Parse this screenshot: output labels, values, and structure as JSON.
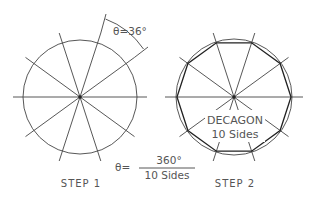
{
  "step1": {
    "label": "STEP 1",
    "angle_annotation": "θ=36°"
  },
  "step2": {
    "label": "STEP 2",
    "shape_name": "DECAGON",
    "sides_label": "10 Sides"
  },
  "formula": {
    "lhs": "θ=",
    "numerator": "360°",
    "denominator": "10 Sides"
  },
  "colors": {
    "stroke": "#444444",
    "polygon": "#222222",
    "text": "#555555",
    "background": "#ffffff"
  }
}
